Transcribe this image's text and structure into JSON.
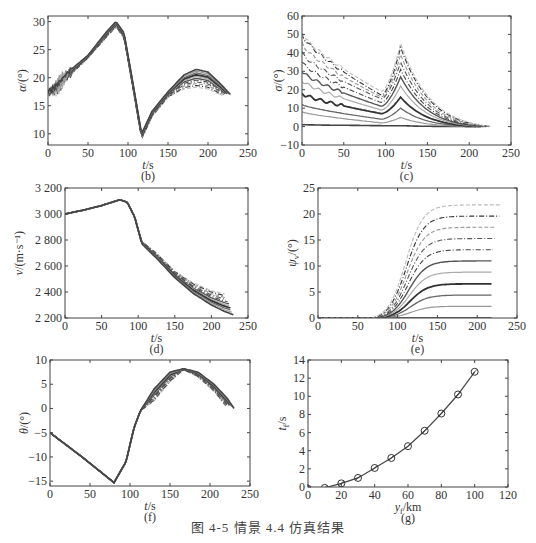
{
  "figure": {
    "caption": "图 4-5   情景 4.4 仿真结果"
  },
  "chart_data": [
    {
      "id": "b",
      "type": "line",
      "panel_label": "(b)",
      "xlabel": "t/s",
      "ylabel": "α/(°)",
      "xlim": [
        0,
        250
      ],
      "ylim": [
        8,
        31
      ],
      "xticks": [
        0,
        50,
        100,
        150,
        200,
        250
      ],
      "yticks": [
        10,
        15,
        20,
        25,
        30
      ],
      "box": [
        48,
        16,
        248,
        145
      ],
      "series_count": 11,
      "description": "Angle of attack: rises ~17→~29.5 at t≈85, drops to ~9 at t≈117, rises to peak 18–21.5 near t≈185, ends ~16–17 at t≈220–230",
      "series_envelope": {
        "x": [
          0,
          10,
          25,
          50,
          75,
          85,
          95,
          105,
          117,
          130,
          150,
          170,
          185,
          200,
          215,
          228
        ],
        "low": [
          17,
          18,
          20,
          23.5,
          27.5,
          29,
          27,
          19,
          9,
          13,
          16.5,
          18,
          18.3,
          18,
          17,
          16
        ],
        "high": [
          17.5,
          18.5,
          21,
          24,
          28.5,
          30,
          28,
          20,
          10,
          14,
          17.5,
          20.5,
          21.5,
          21,
          19,
          17
        ]
      }
    },
    {
      "id": "c",
      "type": "line",
      "panel_label": "(c)",
      "xlabel": "t/s",
      "ylabel": "σ/(°)",
      "xlim": [
        0,
        250
      ],
      "ylim": [
        -10,
        60
      ],
      "xticks": [
        0,
        50,
        100,
        150,
        200,
        250
      ],
      "yticks": [
        -10,
        0,
        10,
        20,
        30,
        40,
        50,
        60
      ],
      "box": [
        302,
        16,
        511,
        145
      ],
      "series": [
        {
          "start": 1,
          "min_at_95": 0.5,
          "peak_118": 0.5
        },
        {
          "start": 8,
          "min_at_95": 2,
          "peak_118": 5
        },
        {
          "start": 12,
          "min_at_95": 4,
          "peak_118": 10
        },
        {
          "start": 18,
          "min_at_95": 7,
          "peak_118": 16
        },
        {
          "start": 25,
          "min_at_95": 9,
          "peak_118": 22
        },
        {
          "start": 30,
          "min_at_95": 11,
          "peak_118": 27
        },
        {
          "start": 35,
          "min_at_95": 13,
          "peak_118": 31
        },
        {
          "start": 40,
          "min_at_95": 15,
          "peak_118": 35
        },
        {
          "start": 45,
          "min_at_95": 16,
          "peak_118": 39
        },
        {
          "start": 50,
          "min_at_95": 17,
          "peak_118": 43
        },
        {
          "start": 51,
          "min_at_95": 19,
          "peak_118": 45
        }
      ],
      "description": "Bank angle family: decreasing from start value to min near t≈95, sharp peak near t≈118–122, decaying to 0 at t≈210–228"
    },
    {
      "id": "d",
      "type": "line",
      "panel_label": "(d)",
      "xlabel": "t/s",
      "ylabel": "v/(m·s⁻¹)",
      "xlim": [
        0,
        250
      ],
      "ylim": [
        2200,
        3200
      ],
      "xticks": [
        0,
        50,
        100,
        150,
        200,
        250
      ],
      "yticks": [
        "2 200",
        "2 400",
        "2 600",
        "2 800",
        "3 000",
        "3 200"
      ],
      "box": [
        65,
        188,
        248,
        318
      ],
      "description": "Velocity: 3000 → ~3110 at t≈75, declines to ~2800 at t≈105, then fans out ending 2380 (t≈218) to 2230 (t≈230)",
      "series_envelope": {
        "x": [
          0,
          25,
          50,
          75,
          85,
          95,
          105,
          125,
          150,
          175,
          200,
          218,
          230
        ],
        "high": [
          3000,
          3030,
          3065,
          3110,
          3090,
          2980,
          2790,
          2700,
          2560,
          2470,
          2410,
          2385,
          2380
        ],
        "low": [
          3000,
          3030,
          3065,
          3110,
          3090,
          2980,
          2770,
          2660,
          2510,
          2390,
          2300,
          2250,
          2225
        ]
      }
    },
    {
      "id": "e",
      "type": "line",
      "panel_label": "(e)",
      "xlabel": "t/s",
      "ylabel": "ψ_v/(°)",
      "xlim": [
        0,
        250
      ],
      "ylim": [
        0,
        25
      ],
      "xticks": [
        0,
        50,
        100,
        150,
        200,
        250
      ],
      "yticks": [
        0,
        5,
        10,
        15,
        20,
        25
      ],
      "box": [
        318,
        188,
        517,
        318
      ],
      "series_final_values": [
        0,
        2.3,
        4.5,
        6.7,
        9,
        11.2,
        13.4,
        15.6,
        17.8,
        20,
        22.2
      ],
      "description": "Heading angle: zero until t≈75–85, S-curve rise saturating by t≈175 at final values 0…22.2"
    },
    {
      "id": "f",
      "type": "line",
      "panel_label": "(f)",
      "xlabel": "t/s",
      "ylabel": "θ/(°)",
      "xlim": [
        0,
        250
      ],
      "ylim": [
        -16,
        10
      ],
      "xticks": [
        0,
        50,
        100,
        150,
        200,
        250
      ],
      "yticks": [
        -15,
        -10,
        -5,
        0,
        5,
        10
      ],
      "box": [
        50,
        360,
        250,
        486
      ],
      "description": "Flight path angle: -5 → -15.3 at t≈80, rises to 0 at t≈113, to ~8 at t≈165–170, back to 0 at t≈220–230",
      "series_envelope": {
        "x": [
          0,
          40,
          80,
          95,
          105,
          113,
          130,
          150,
          167,
          185,
          205,
          222,
          230
        ],
        "low": [
          -5,
          -10,
          -15.3,
          -11,
          -4,
          -0.5,
          1.5,
          5.5,
          8,
          6.5,
          3.5,
          0,
          0
        ],
        "high": [
          -5,
          -10,
          -15.3,
          -11,
          -4,
          -0.5,
          4,
          7.5,
          8.2,
          7.5,
          5,
          2,
          0
        ]
      }
    },
    {
      "id": "g",
      "type": "line",
      "panel_label": "(g)",
      "xlabel": "y_f/km",
      "ylabel": "t_f/s",
      "xlim": [
        0,
        120
      ],
      "ylim": [
        0,
        14
      ],
      "xticks": [
        0,
        20,
        40,
        60,
        80,
        100,
        120
      ],
      "yticks": [
        0,
        2,
        4,
        6,
        8,
        10,
        12,
        14
      ],
      "box": [
        308,
        360,
        508,
        487
      ],
      "marker": "circle",
      "x": [
        0,
        10,
        20,
        30,
        40,
        50,
        60,
        70,
        80,
        90,
        100
      ],
      "values": [
        -0.2,
        -0.1,
        0.4,
        1.0,
        2.1,
        3.2,
        4.5,
        6.2,
        8.1,
        10.2,
        12.7
      ]
    }
  ]
}
